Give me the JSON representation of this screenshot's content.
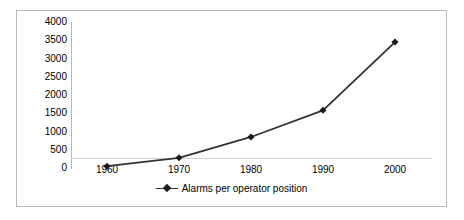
{
  "chart_data": {
    "type": "line",
    "title": "",
    "xlabel": "",
    "ylabel": "",
    "x": [
      1960,
      1970,
      1980,
      1990,
      2000
    ],
    "categories": [
      "1960",
      "1970",
      "1980",
      "1990",
      "2000"
    ],
    "series": [
      {
        "name": "Alarms per operator position",
        "values": [
          50,
          280,
          850,
          1580,
          3450
        ],
        "color": "#333333",
        "marker": "diamond",
        "marker_color": "#1a1a1a"
      }
    ],
    "ylim": [
      0,
      4000
    ],
    "ytick_labels": [
      "0",
      "500",
      "1000",
      "1500",
      "2000",
      "2500",
      "3000",
      "3500",
      "4000"
    ],
    "ytick_values": [
      0,
      500,
      1000,
      1500,
      2000,
      2500,
      3000,
      3500,
      4000
    ],
    "xtick_labels": [
      "1960",
      "1970",
      "1980",
      "1990",
      "2000"
    ],
    "grid": false,
    "legend_position": "bottom",
    "legend_entries": [
      "Alarms per operator position"
    ],
    "axis_color": "#b9b9b9",
    "baseline_color": "#d2d2d2",
    "border_color": "#b9b9b9",
    "background_color": "#ffffff"
  }
}
